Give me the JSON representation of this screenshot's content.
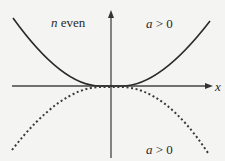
{
  "diagram": {
    "type": "function-graph",
    "labels": {
      "n_var": "n",
      "n_text": " even",
      "top_a_var": "a",
      "top_a_text": " > 0",
      "bottom_a_var": "a",
      "bottom_a_text": " > 0",
      "x_axis": "x"
    },
    "curves": [
      {
        "name": "upward-parabola",
        "style": "solid",
        "color": "#2a2a2a"
      },
      {
        "name": "downward-parabola",
        "style": "dotted",
        "color": "#3a3a3a"
      }
    ],
    "axes": {
      "color": "#444444"
    }
  }
}
